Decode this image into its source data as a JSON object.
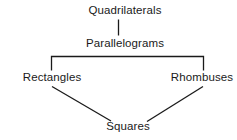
{
  "diagram": {
    "background_color": "#ffffff",
    "line_color": "#1a1a1a",
    "text_color": "#1a1a1a",
    "nodes": [
      {
        "id": "quadrilaterals",
        "label": "Quadrilaterals",
        "level": 0
      },
      {
        "id": "parallelograms",
        "label": "Parallelograms",
        "level": 1
      },
      {
        "id": "rectangles",
        "label": "Rectangles",
        "level": 2
      },
      {
        "id": "rhombuses",
        "label": "Rhombuses",
        "level": 2
      },
      {
        "id": "squares",
        "label": "Squares",
        "level": 3
      }
    ],
    "edges": [
      {
        "from": "quadrilaterals",
        "to": "parallelograms",
        "style": "vertical"
      },
      {
        "from": "parallelograms",
        "to": "rectangles",
        "style": "bracket"
      },
      {
        "from": "parallelograms",
        "to": "rhombuses",
        "style": "bracket"
      },
      {
        "from": "rectangles",
        "to": "squares",
        "style": "diagonal"
      },
      {
        "from": "rhombuses",
        "to": "squares",
        "style": "diagonal"
      }
    ]
  }
}
